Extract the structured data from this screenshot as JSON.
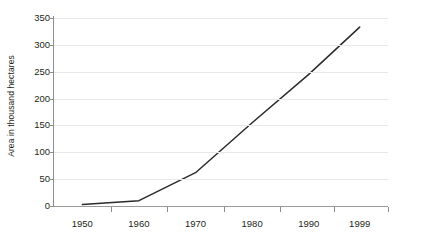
{
  "chart_data": {
    "type": "line",
    "title": "",
    "subtitle": "",
    "xlabel": "",
    "ylabel": "Area in thousand hectares",
    "x": [
      1950,
      1960,
      1970,
      1980,
      1990,
      1999
    ],
    "x_tick_labels": [
      "1950",
      "1960",
      "1970",
      "1980",
      "1990",
      "1999"
    ],
    "y_tick_labels": [
      "350",
      "300",
      "250",
      "200",
      "150",
      "100",
      "50",
      "0"
    ],
    "y_ticks": [
      0,
      50,
      100,
      150,
      200,
      250,
      300,
      350
    ],
    "xlim": [
      1945,
      2004
    ],
    "ylim": [
      0,
      350
    ],
    "grid": "horizontal",
    "legend": "none",
    "series": [
      {
        "name": "Area in thousand hectares",
        "color": "#2b2b2b",
        "values": [
          3,
          10,
          62,
          155,
          245,
          333
        ]
      }
    ],
    "annotations": []
  },
  "axes": {
    "y_title": "Area in thousand hectares",
    "y_labels": [
      "350",
      "300",
      "250",
      "200",
      "150",
      "100",
      "50",
      "0"
    ],
    "x_labels": [
      "1950",
      "1960",
      "1970",
      "1980",
      "1990",
      "1999"
    ]
  },
  "style": {
    "background": "#ffffff",
    "grid_color": "#e8e8e8",
    "axis_color": "#8d8d8d",
    "line_color": "#2b2b2b",
    "text_color": "#231f20"
  }
}
